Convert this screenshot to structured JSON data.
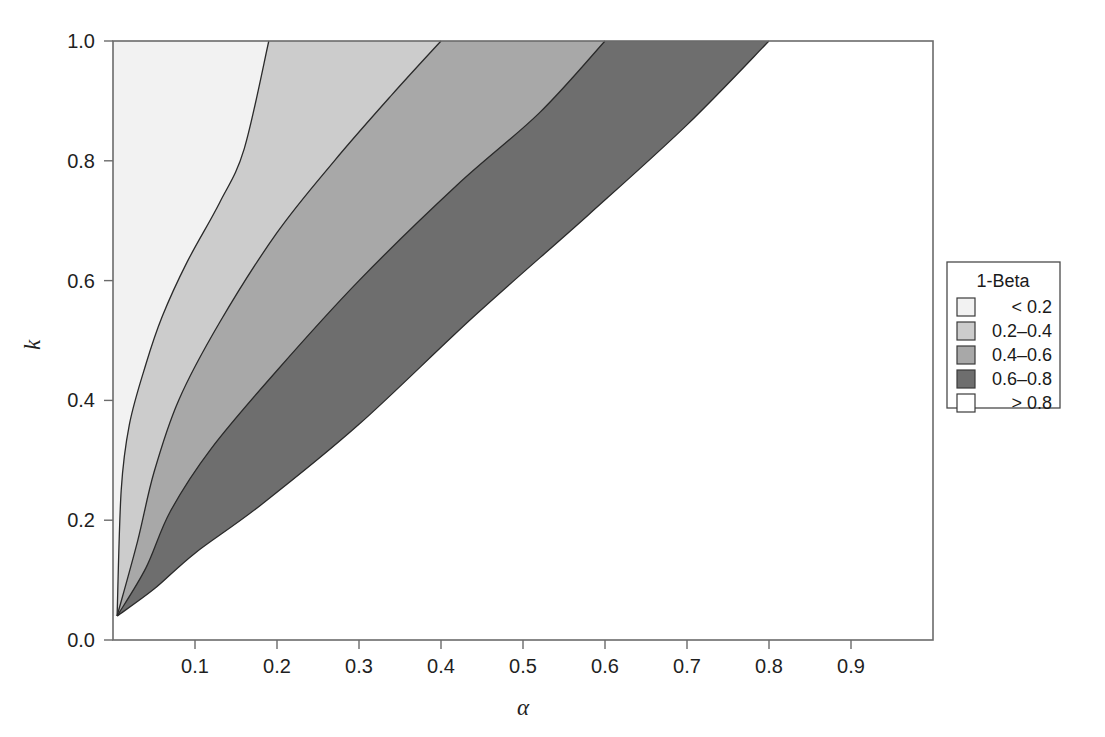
{
  "chart_data": {
    "type": "contour",
    "title": "",
    "xlabel": "α",
    "ylabel": "k",
    "xlim": [
      0.0,
      1.0
    ],
    "ylim": [
      0.0,
      1.0
    ],
    "xticks": [
      "0.1",
      "0.2",
      "0.3",
      "0.4",
      "0.5",
      "0.6",
      "0.7",
      "0.8",
      "0.9"
    ],
    "xtick_values": [
      0.1,
      0.2,
      0.3,
      0.4,
      0.5,
      0.6,
      0.7,
      0.8,
      0.9
    ],
    "yticks": [
      "0.0",
      "0.2",
      "0.4",
      "0.6",
      "0.8",
      "1.0"
    ],
    "ytick_values": [
      0.0,
      0.2,
      0.4,
      0.6,
      0.8,
      1.0
    ],
    "grid": false,
    "legend_position": "right",
    "legend_title": "1-Beta",
    "levels": [
      {
        "label": "< 0.2",
        "color": "#f2f2f2",
        "range": [
          0.0,
          0.2
        ],
        "boundary_upper": [
          {
            "alpha": 0.005,
            "k": 0.04
          },
          {
            "alpha": 0.01,
            "k": 0.25
          },
          {
            "alpha": 0.02,
            "k": 0.36
          },
          {
            "alpha": 0.04,
            "k": 0.46
          },
          {
            "alpha": 0.06,
            "k": 0.54
          },
          {
            "alpha": 0.09,
            "k": 0.63
          },
          {
            "alpha": 0.13,
            "k": 0.73
          },
          {
            "alpha": 0.16,
            "k": 0.82
          },
          {
            "alpha": 0.19,
            "k": 1.0
          }
        ]
      },
      {
        "label": "0.2–0.4",
        "color": "#cccccc",
        "range": [
          0.2,
          0.4
        ],
        "boundary_upper": [
          {
            "alpha": 0.005,
            "k": 0.04
          },
          {
            "alpha": 0.03,
            "k": 0.165
          },
          {
            "alpha": 0.05,
            "k": 0.28
          },
          {
            "alpha": 0.08,
            "k": 0.4
          },
          {
            "alpha": 0.13,
            "k": 0.53
          },
          {
            "alpha": 0.2,
            "k": 0.68
          },
          {
            "alpha": 0.27,
            "k": 0.8
          },
          {
            "alpha": 0.34,
            "k": 0.91
          },
          {
            "alpha": 0.4,
            "k": 1.0
          }
        ]
      },
      {
        "label": "0.4–0.6",
        "color": "#a8a8a8",
        "range": [
          0.4,
          0.6
        ],
        "boundary_upper": [
          {
            "alpha": 0.005,
            "k": 0.04
          },
          {
            "alpha": 0.04,
            "k": 0.12
          },
          {
            "alpha": 0.07,
            "k": 0.215
          },
          {
            "alpha": 0.12,
            "k": 0.32
          },
          {
            "alpha": 0.2,
            "k": 0.45
          },
          {
            "alpha": 0.3,
            "k": 0.6
          },
          {
            "alpha": 0.42,
            "k": 0.76
          },
          {
            "alpha": 0.52,
            "k": 0.88
          },
          {
            "alpha": 0.6,
            "k": 1.0
          }
        ]
      },
      {
        "label": "0.6–0.8",
        "color": "#6e6e6e",
        "range": [
          0.6,
          0.8
        ],
        "boundary_upper": [
          {
            "alpha": 0.005,
            "k": 0.04
          },
          {
            "alpha": 0.05,
            "k": 0.085
          },
          {
            "alpha": 0.1,
            "k": 0.145
          },
          {
            "alpha": 0.18,
            "k": 0.225
          },
          {
            "alpha": 0.3,
            "k": 0.36
          },
          {
            "alpha": 0.44,
            "k": 0.54
          },
          {
            "alpha": 0.58,
            "k": 0.71
          },
          {
            "alpha": 0.7,
            "k": 0.86
          },
          {
            "alpha": 0.8,
            "k": 1.0
          }
        ]
      },
      {
        "label": "> 0.8",
        "color": "#ffffff",
        "range": [
          0.8,
          1.0
        ],
        "boundary_upper": null
      }
    ]
  },
  "legend": {
    "title": "1-Beta",
    "entries": [
      {
        "label": "< 0.2",
        "color": "#f2f2f2"
      },
      {
        "label": "0.2–0.4",
        "color": "#cccccc"
      },
      {
        "label": "0.4–0.6",
        "color": "#a8a8a8"
      },
      {
        "label": "0.6–0.8",
        "color": "#6e6e6e"
      },
      {
        "label": "> 0.8",
        "color": "#ffffff"
      }
    ]
  },
  "axes": {
    "x_title": "α",
    "y_title": "k",
    "x_tick_labels": [
      "0.1",
      "0.2",
      "0.3",
      "0.4",
      "0.5",
      "0.6",
      "0.7",
      "0.8",
      "0.9"
    ],
    "y_tick_labels": [
      "0.0",
      "0.2",
      "0.4",
      "0.6",
      "0.8",
      "1.0"
    ]
  }
}
